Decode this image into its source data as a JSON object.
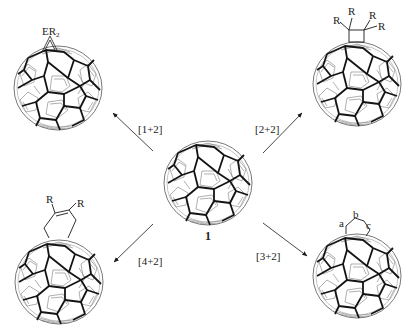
{
  "diagram": {
    "type": "reaction-scheme",
    "colors": {
      "line": "#1a1a1a",
      "thin": "#6e6e6e",
      "background": "#ffffff"
    },
    "center": {
      "id": "1",
      "label": "1",
      "cx": 208,
      "cy": 183,
      "r": 45
    },
    "reactions": [
      {
        "id": "one-plus-two",
        "label": "[1+2]",
        "product_cx": 58,
        "product_cy": 88,
        "arrow": {
          "x1": 153,
          "y1": 151,
          "x2": 113,
          "y2": 113
        },
        "label_x": 126,
        "label_y": 133,
        "substituent": {
          "text_main": "ER",
          "text_sub": "2"
        }
      },
      {
        "id": "two-plus-two",
        "label": "[2+2]",
        "product_cx": 357,
        "product_cy": 84,
        "arrow": {
          "x1": 263,
          "y1": 153,
          "x2": 302,
          "y2": 113
        },
        "label_x": 255,
        "label_y": 133,
        "substituent": {
          "labels": [
            "R",
            "R",
            "R",
            "R"
          ]
        }
      },
      {
        "id": "four-plus-two",
        "label": "[4+2]",
        "product_cx": 59,
        "product_cy": 282,
        "arrow": {
          "x1": 153,
          "y1": 224,
          "x2": 114,
          "y2": 262
        },
        "label_x": 138,
        "label_y": 265,
        "substituent": {
          "labels": [
            "R",
            "R"
          ]
        }
      },
      {
        "id": "three-plus-two",
        "label": "[3+2]",
        "product_cx": 357,
        "product_cy": 276,
        "arrow": {
          "x1": 263,
          "y1": 223,
          "x2": 307,
          "y2": 256
        },
        "label_x": 255,
        "label_y": 260,
        "substituent": {
          "labels": [
            "a",
            "b",
            "c"
          ]
        }
      }
    ]
  }
}
